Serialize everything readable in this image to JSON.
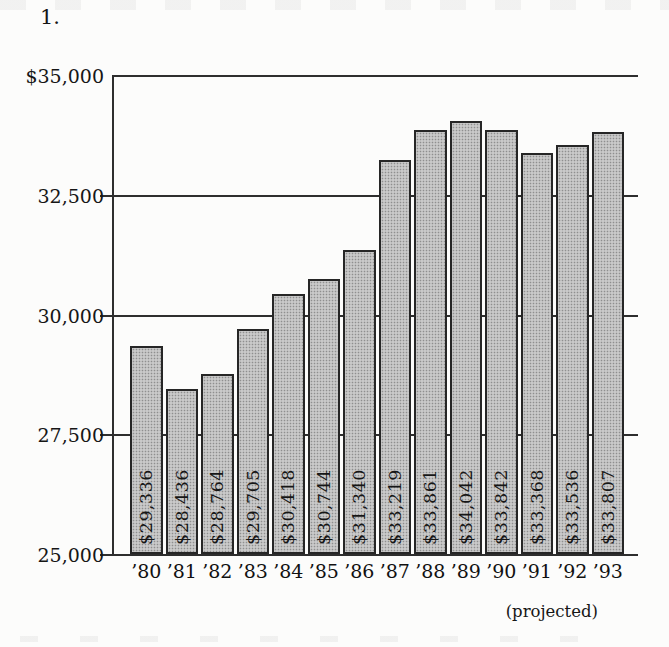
{
  "page": {
    "item_number": "1.",
    "background": "#fcfcfb"
  },
  "chart_data": {
    "type": "bar",
    "title": "",
    "categories": [
      "’80",
      "’81",
      "’82",
      "’83",
      "’84",
      "’85",
      "’86",
      "’87",
      "’88",
      "’89",
      "’90",
      "’91",
      "’92",
      "’93"
    ],
    "values": [
      29336,
      28436,
      28764,
      29705,
      30418,
      30744,
      31340,
      33219,
      33861,
      34042,
      33842,
      33368,
      33536,
      33807
    ],
    "bar_value_labels": [
      "$29,336",
      "$28,436",
      "$28,764",
      "$29,705",
      "$30,418",
      "$30,744",
      "$31,340",
      "$33,219",
      "$33,861",
      "$34,042",
      "$33,842",
      "$33,368",
      "$33,536",
      "$33,807"
    ],
    "xlabel": "",
    "ylabel": "",
    "ylim": [
      25000,
      35000
    ],
    "y_ticks": [
      {
        "label": "$35,000",
        "value": 35000
      },
      {
        "label": "32,500",
        "value": 32500
      },
      {
        "label": "30,000",
        "value": 30000
      },
      {
        "label": "27,500",
        "value": 27500
      },
      {
        "label": "25,000",
        "value": 25000
      }
    ],
    "x_axis_note": "(projected)",
    "grid": true,
    "legend": "none",
    "bar_fill": "#c9c9c9",
    "bar_stipple": "#8f8f8f",
    "bar_border": "#262626",
    "axis_color": "#2e2e2e",
    "text_color": "#161616"
  }
}
